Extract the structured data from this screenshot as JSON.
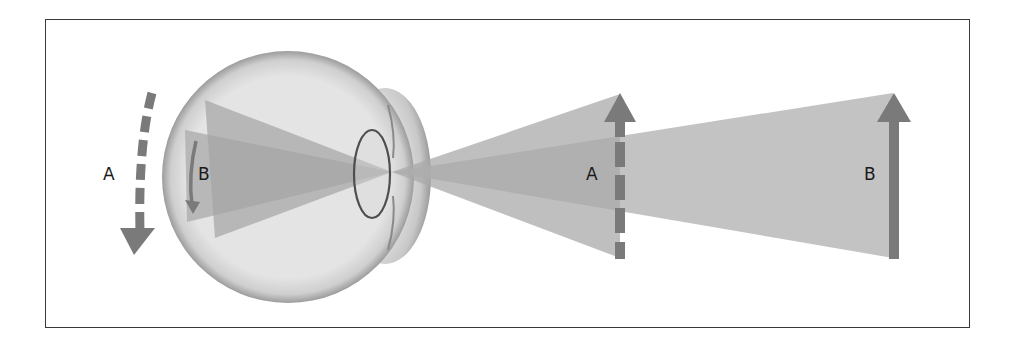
{
  "figure": {
    "labels": {
      "retina_outer": "A",
      "retina_inner": "B",
      "object_near": "A",
      "object_far": "B"
    },
    "colors": {
      "frame": "#3a3a3a",
      "arrow": "#7a7a7a",
      "ray_cone": "#b8b8b8",
      "eyeball_fill": "#e6e6e6",
      "eyeball_edge": "#9a9a9a",
      "lens_stroke": "#555555",
      "text": "#1a1a1a"
    }
  }
}
